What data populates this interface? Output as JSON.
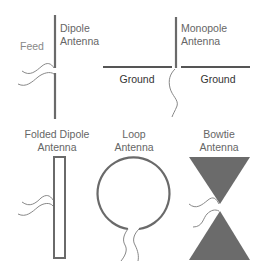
{
  "diagram": {
    "colors": {
      "line": "#6a6a6a",
      "fill": "#6b6b6b",
      "text": "#666666",
      "feed": "#888888"
    },
    "panels": [
      {
        "id": "dipole",
        "name": "Dipole Antenna",
        "label_line1": "Dipole",
        "label_line2": "Antenna",
        "feed_label": "Feed"
      },
      {
        "id": "monopole",
        "name": "Monopole Antenna",
        "label_line1": "Monopole",
        "label_line2": "Antenna",
        "ground_left": "Ground",
        "ground_right": "Ground"
      },
      {
        "id": "folded-dipole",
        "name": "Folded Dipole Antenna",
        "label_line1": "Folded Dipole",
        "label_line2": "Antenna"
      },
      {
        "id": "loop",
        "name": "Loop Antenna",
        "label_line1": "Loop",
        "label_line2": "Antenna"
      },
      {
        "id": "bowtie",
        "name": "Bowtie Antenna",
        "label_line1": "Bowtie",
        "label_line2": "Antenna"
      }
    ]
  }
}
